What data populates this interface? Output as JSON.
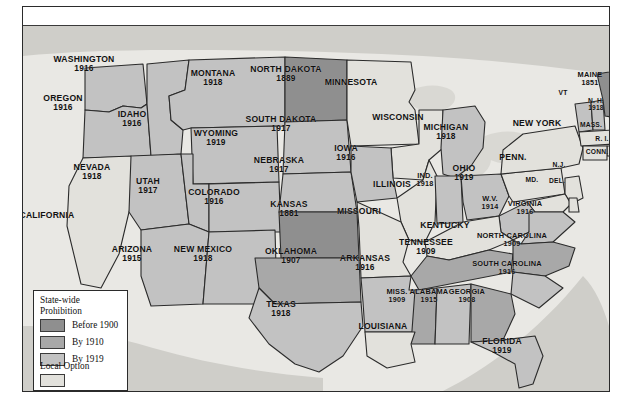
{
  "figure": {
    "kind": "thematic-choropleth-map"
  },
  "legend": {
    "title_line1": "State-wide",
    "title_line2": "Prohibition",
    "items": [
      {
        "label": "Before 1900",
        "color": "#8f8f8f"
      },
      {
        "label": "By 1910",
        "color": "#a8a8a8"
      },
      {
        "label": "By 1919",
        "color": "#c2c2c2"
      }
    ],
    "local_option_label": "Local Option",
    "local_option_color": "#e2e1dc"
  },
  "colors": {
    "before_1900": "#8f8f8f",
    "by_1910": "#a8a8a8",
    "by_1919": "#c2c2c2",
    "local_option": "#e2e1dc",
    "water": "#d9d8d3",
    "land_outside": "#cfcec9",
    "border": "#2b2b2b",
    "background": "#e9e8e4"
  },
  "map": {
    "states": [
      {
        "name": "WASHINGTON",
        "year": "1916",
        "category": "by_1919",
        "x": 83,
        "y": 63,
        "size": "n"
      },
      {
        "name": "OREGON",
        "year": "1916",
        "category": "by_1919",
        "x": 62,
        "y": 102,
        "size": "n"
      },
      {
        "name": "IDAHO",
        "year": "1916",
        "category": "by_1919",
        "x": 131,
        "y": 118,
        "size": "n"
      },
      {
        "name": "MONTANA",
        "year": "1918",
        "category": "by_1919",
        "x": 212,
        "y": 77,
        "size": "n"
      },
      {
        "name": "NORTH DAKOTA",
        "year": "1889",
        "category": "before_1900",
        "x": 285,
        "y": 73,
        "size": "n"
      },
      {
        "name": "SOUTH DAKOTA",
        "year": "1917",
        "category": "by_1919",
        "x": 280,
        "y": 123,
        "size": "n"
      },
      {
        "name": "MINNESOTA",
        "year": "",
        "category": "local_option",
        "x": 350,
        "y": 81,
        "size": "n"
      },
      {
        "name": "WISCONSIN",
        "year": "",
        "category": "local_option",
        "x": 397,
        "y": 116,
        "size": "n"
      },
      {
        "name": "WYOMING",
        "year": "1919",
        "category": "by_1919",
        "x": 215,
        "y": 137,
        "size": "n"
      },
      {
        "name": "NEBRASKA",
        "year": "1917",
        "category": "by_1919",
        "x": 278,
        "y": 164,
        "size": "n"
      },
      {
        "name": "IOWA",
        "year": "1916",
        "category": "by_1919",
        "x": 345,
        "y": 152,
        "size": "n"
      },
      {
        "name": "NEVADA",
        "year": "1918",
        "category": "by_1919",
        "x": 91,
        "y": 171,
        "size": "n"
      },
      {
        "name": "UTAH",
        "year": "1917",
        "category": "by_1919",
        "x": 147,
        "y": 185,
        "size": "n"
      },
      {
        "name": "COLORADO",
        "year": "1916",
        "category": "by_1919",
        "x": 213,
        "y": 196,
        "size": "n"
      },
      {
        "name": "KANSAS",
        "year": "1881",
        "category": "before_1900",
        "x": 288,
        "y": 208,
        "size": "n"
      },
      {
        "name": "MISSOURI",
        "year": "",
        "category": "local_option",
        "x": 358,
        "y": 210,
        "size": "n"
      },
      {
        "name": "ILLINOIS",
        "year": "",
        "category": "local_option",
        "x": 391,
        "y": 183,
        "size": "n"
      },
      {
        "name": "MICHIGAN",
        "year": "1918",
        "category": "by_1919",
        "x": 445,
        "y": 131,
        "size": "n"
      },
      {
        "name": "IND.",
        "year": "1918",
        "category": "by_1919",
        "x": 424,
        "y": 178,
        "size": "sm"
      },
      {
        "name": "OHIO",
        "year": "1919",
        "category": "by_1919",
        "x": 463,
        "y": 172,
        "size": "n"
      },
      {
        "name": "PENN.",
        "year": "",
        "category": "local_option",
        "x": 512,
        "y": 156,
        "size": "n"
      },
      {
        "name": "NEW YORK",
        "year": "",
        "category": "local_option",
        "x": 536,
        "y": 122,
        "size": "n"
      },
      {
        "name": "VT",
        "year": "",
        "category": "by_1919",
        "x": 562,
        "y": 92,
        "size": "xs"
      },
      {
        "name": "MAINE",
        "year": "1851",
        "category": "before_1900",
        "x": 589,
        "y": 77,
        "size": "sm"
      },
      {
        "name": "N. H.",
        "year": "1918",
        "category": "by_1919",
        "x": 595,
        "y": 104,
        "size": "xs"
      },
      {
        "name": "MASS.",
        "year": "",
        "category": "local_option",
        "x": 590,
        "y": 124,
        "size": "xs"
      },
      {
        "name": "R. I.",
        "year": "",
        "category": "local_option",
        "x": 601,
        "y": 138,
        "size": "xs"
      },
      {
        "name": "CONN.",
        "year": "",
        "category": "local_option",
        "x": 596,
        "y": 151,
        "size": "xs"
      },
      {
        "name": "N.J.",
        "year": "",
        "category": "local_option",
        "x": 558,
        "y": 164,
        "size": "xs"
      },
      {
        "name": "MD.",
        "year": "",
        "category": "local_option",
        "x": 531,
        "y": 179,
        "size": "xs"
      },
      {
        "name": "DEL.",
        "year": "",
        "category": "local_option",
        "x": 556,
        "y": 180,
        "size": "xs"
      },
      {
        "name": "W.V.",
        "year": "1914",
        "category": "by_1919",
        "x": 489,
        "y": 201,
        "size": "sm"
      },
      {
        "name": "VIRGINIA",
        "year": "1916",
        "category": "by_1919",
        "x": 524,
        "y": 206,
        "size": "sm"
      },
      {
        "name": "KENTUCKY",
        "year": "",
        "category": "local_option",
        "x": 444,
        "y": 224,
        "size": "n"
      },
      {
        "name": "CALIFORNIA",
        "year": "",
        "category": "local_option",
        "x": 46,
        "y": 214,
        "size": "n"
      },
      {
        "name": "ARIZONA",
        "year": "1915",
        "category": "by_1919",
        "x": 131,
        "y": 253,
        "size": "n"
      },
      {
        "name": "NEW MEXICO",
        "year": "1918",
        "category": "by_1919",
        "x": 202,
        "y": 253,
        "size": "n"
      },
      {
        "name": "OKLAHOMA",
        "year": "1907",
        "category": "by_1910",
        "x": 290,
        "y": 255,
        "size": "n"
      },
      {
        "name": "ARKANSAS",
        "year": "1916",
        "category": "by_1919",
        "x": 364,
        "y": 262,
        "size": "n"
      },
      {
        "name": "TENNESSEE",
        "year": "1909",
        "category": "by_1910",
        "x": 425,
        "y": 246,
        "size": "n"
      },
      {
        "name": "NORTH CAROLINA",
        "year": "1909",
        "category": "by_1910",
        "x": 511,
        "y": 238,
        "size": "sm"
      },
      {
        "name": "SOUTH CAROLINA",
        "year": "1916",
        "category": "by_1919",
        "x": 506,
        "y": 266,
        "size": "sm"
      },
      {
        "name": "MISS.",
        "year": "1909",
        "category": "by_1910",
        "x": 396,
        "y": 294,
        "size": "sm"
      },
      {
        "name": "ALABAMA",
        "year": "1915",
        "category": "by_1919",
        "x": 428,
        "y": 294,
        "size": "sm"
      },
      {
        "name": "GEORGIA",
        "year": "1908",
        "category": "by_1910",
        "x": 466,
        "y": 294,
        "size": "sm"
      },
      {
        "name": "TEXAS",
        "year": "1918",
        "category": "by_1919",
        "x": 280,
        "y": 308,
        "size": "n"
      },
      {
        "name": "LOUISIANA",
        "year": "",
        "category": "local_option",
        "x": 382,
        "y": 325,
        "size": "n"
      },
      {
        "name": "FLORIDA",
        "year": "1919",
        "category": "by_1919",
        "x": 501,
        "y": 345,
        "size": "n"
      }
    ]
  }
}
